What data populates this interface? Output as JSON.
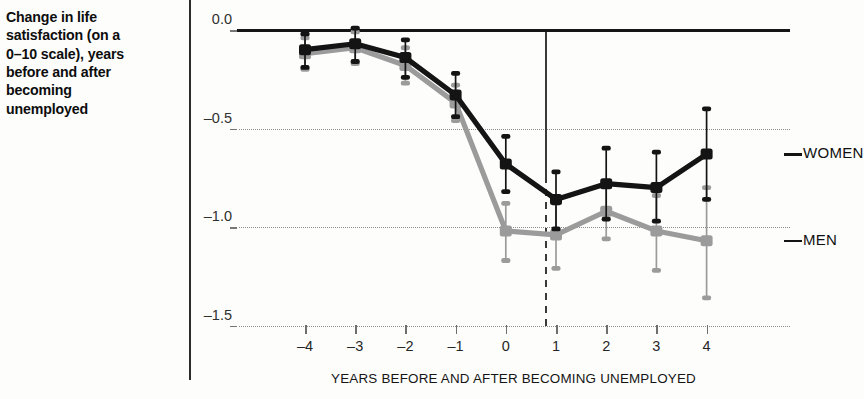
{
  "caption": {
    "text": "Change in life\nsatisfaction (on a\n0–10 scale), years\nbefore and after\nbecoming\nunemployed"
  },
  "chart_data": {
    "type": "line",
    "title": "",
    "xlabel": "YEARS BEFORE AND AFTER BECOMING UNEMPLOYED",
    "ylabel": "",
    "x": [
      -4,
      -3,
      -2,
      -1,
      0,
      1,
      2,
      3,
      4
    ],
    "xtick_labels": [
      "–4",
      "–3",
      "–2",
      "–1",
      "0",
      "1",
      "2",
      "3",
      "4"
    ],
    "ytick_labels": [
      "0.0",
      "–0.5",
      "–1.0",
      "–1.5"
    ],
    "ytick_values": [
      0.0,
      -0.5,
      -1.0,
      -1.5
    ],
    "ylim": [
      -1.62,
      0.08
    ],
    "xlim": [
      -4.55,
      4.55
    ],
    "grid": "horizontal-dotted",
    "legend_position": "right-inline",
    "reference_line_x": 0,
    "series": [
      {
        "name": "WOMEN",
        "color": "#141414",
        "values": [
          -0.1,
          -0.07,
          -0.14,
          -0.33,
          -0.68,
          -0.86,
          -0.78,
          -0.8,
          -0.63
        ],
        "err_low": [
          -0.19,
          -0.16,
          -0.24,
          -0.44,
          -0.82,
          -1.01,
          -0.96,
          -0.97,
          -0.86
        ],
        "err_high": [
          -0.02,
          0.01,
          -0.05,
          -0.22,
          -0.54,
          -0.72,
          -0.6,
          -0.62,
          -0.4
        ]
      },
      {
        "name": "MEN",
        "color": "#9b9b9b",
        "values": [
          -0.12,
          -0.09,
          -0.18,
          -0.37,
          -1.02,
          -1.04,
          -0.92,
          -1.02,
          -1.07
        ],
        "err_low": [
          -0.2,
          -0.17,
          -0.27,
          -0.46,
          -1.17,
          -1.21,
          -1.06,
          -1.22,
          -1.36
        ],
        "err_high": [
          -0.04,
          -0.01,
          -0.09,
          -0.28,
          -0.88,
          -0.88,
          -0.78,
          -0.84,
          -0.8
        ]
      }
    ]
  },
  "legend": {
    "women": "WOMEN",
    "men": "MEN"
  }
}
